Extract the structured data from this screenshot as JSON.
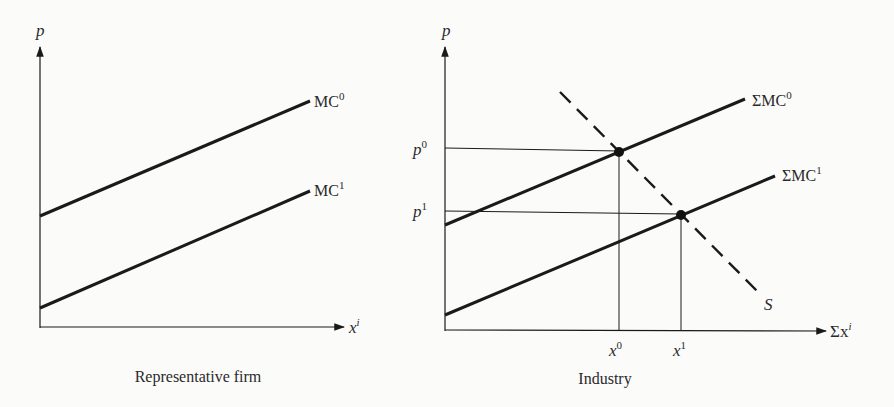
{
  "panels": [
    {
      "id": "representative-firm",
      "caption": "Representative firm",
      "y_axis_label": "p",
      "x_axis_label": "x",
      "x_axis_label_sup": "i",
      "curves": [
        {
          "name": "MC",
          "sup": "0"
        },
        {
          "name": "MC",
          "sup": "1"
        }
      ]
    },
    {
      "id": "industry",
      "caption": "Industry",
      "y_axis_label": "p",
      "x_axis_label": "Σx",
      "x_axis_label_sup": "i",
      "curves": [
        {
          "name": "ΣMC",
          "sup": "0"
        },
        {
          "name": "ΣMC",
          "sup": "1"
        },
        {
          "name": "S",
          "sup": ""
        }
      ],
      "y_ticks": [
        {
          "name": "p",
          "sup": "0"
        },
        {
          "name": "p",
          "sup": "1"
        }
      ],
      "x_ticks": [
        {
          "name": "x",
          "sup": "0"
        },
        {
          "name": "x",
          "sup": "1"
        }
      ]
    }
  ],
  "colors": {
    "ink": "#1a1a1a",
    "background": "#fbfbfa"
  }
}
